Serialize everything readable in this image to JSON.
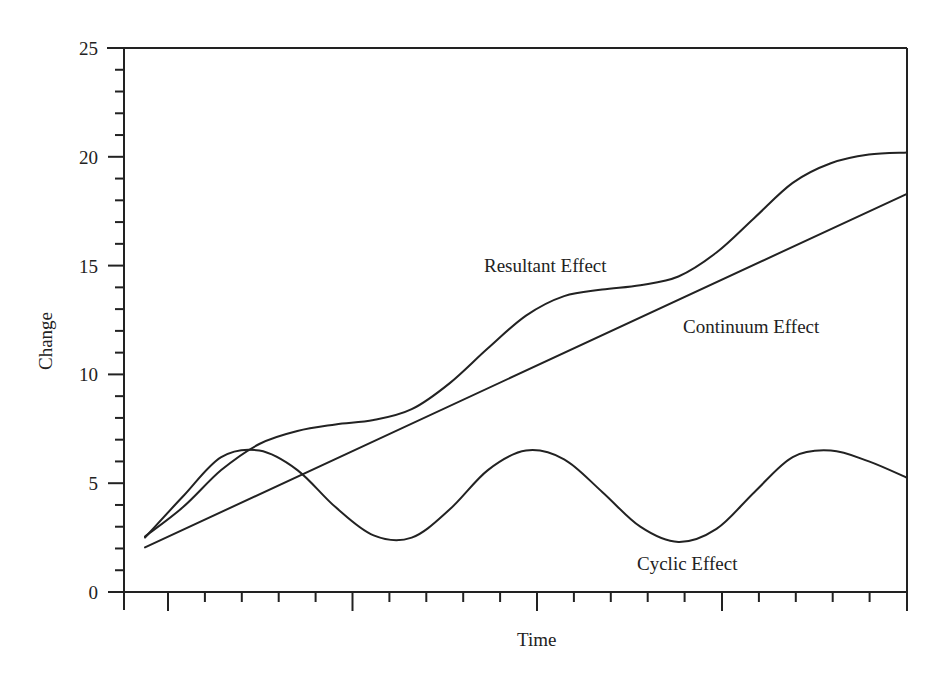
{
  "chart_data": {
    "type": "line",
    "title": "",
    "xlabel": "Time",
    "ylabel": "Change",
    "ylim": [
      0,
      25
    ],
    "yticks": [
      0,
      5,
      10,
      15,
      20,
      25
    ],
    "y_minor_step": 1,
    "x_tick_labels": [],
    "x_major_ticks": 4,
    "x_minor_per_major": 5,
    "grid": false,
    "legend": "none (inline annotations)",
    "x": [
      0.0,
      0.05,
      0.1,
      0.15,
      0.2,
      0.25,
      0.3,
      0.35,
      0.4,
      0.45,
      0.5,
      0.55,
      0.6,
      0.65,
      0.7,
      0.75,
      0.8,
      0.85,
      0.9,
      0.95,
      1.0
    ],
    "series": [
      {
        "name": "Resultant Effect",
        "values": [
          2.55,
          3.9,
          5.6,
          6.8,
          7.4,
          7.7,
          7.9,
          8.4,
          9.6,
          11.2,
          12.7,
          13.6,
          13.9,
          14.1,
          14.5,
          15.6,
          17.2,
          18.8,
          19.7,
          20.1,
          20.2
        ]
      },
      {
        "name": "Continuum Effect",
        "values": [
          2.05,
          2.86,
          3.67,
          4.48,
          5.29,
          6.1,
          6.91,
          7.72,
          8.53,
          9.34,
          10.15,
          10.96,
          11.77,
          12.58,
          13.39,
          14.2,
          15.01,
          15.82,
          16.63,
          17.44,
          18.3
        ]
      },
      {
        "name": "Cyclic Effect",
        "values": [
          2.5,
          4.4,
          6.2,
          6.5,
          5.6,
          3.9,
          2.6,
          2.5,
          3.8,
          5.6,
          6.5,
          6.1,
          4.6,
          3.0,
          2.3,
          2.9,
          4.6,
          6.2,
          6.5,
          6.0,
          5.25
        ]
      }
    ],
    "annotations": [
      {
        "text": "Resultant Effect",
        "near_series": "Resultant Effect"
      },
      {
        "text": "Continuum Effect",
        "near_series": "Continuum Effect"
      },
      {
        "text": "Cyclic Effect",
        "near_series": "Cyclic Effect"
      }
    ]
  },
  "labels": {
    "ylabel": "Change",
    "xlabel": "Time",
    "resultant": "Resultant Effect",
    "continuum": "Continuum Effect",
    "cyclic": "Cyclic Effect"
  }
}
